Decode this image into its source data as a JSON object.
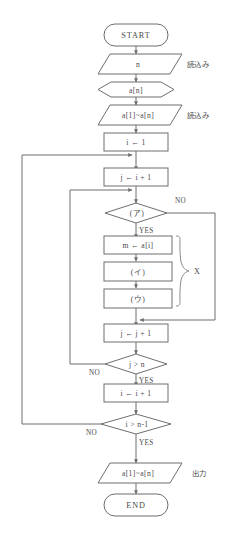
{
  "diagram": {
    "colors": {
      "stroke": "#6e6e6e",
      "text": "#4a4a4a",
      "background": "#ffffff",
      "brace": "#8a8a8a"
    },
    "nodes": [
      {
        "id": "start",
        "shape": "terminator",
        "label": "START"
      },
      {
        "id": "read-n",
        "shape": "parallelogram",
        "label": "n"
      },
      {
        "id": "prepare-an",
        "shape": "hexagon",
        "label": "a[n]"
      },
      {
        "id": "read-array",
        "shape": "parallelogram",
        "label": "a[1]~a[n]"
      },
      {
        "id": "init-i",
        "shape": "process",
        "label": "i ← 1"
      },
      {
        "id": "set-j",
        "shape": "process",
        "label": "j ← i + 1"
      },
      {
        "id": "cond-a",
        "shape": "decision",
        "label": "(ア)"
      },
      {
        "id": "set-m",
        "shape": "process",
        "label": "m ← a[i]"
      },
      {
        "id": "step-i2",
        "shape": "process",
        "label": "(イ)"
      },
      {
        "id": "step-u",
        "shape": "process",
        "label": "(ウ)"
      },
      {
        "id": "incr-j",
        "shape": "process",
        "label": "j ← j + 1"
      },
      {
        "id": "cond-j",
        "shape": "decision",
        "label": "j > n"
      },
      {
        "id": "incr-i",
        "shape": "process",
        "label": "i ← i + 1"
      },
      {
        "id": "cond-i",
        "shape": "decision",
        "label": "i > n-1"
      },
      {
        "id": "output",
        "shape": "parallelogram",
        "label": "a[1]~a[n]"
      },
      {
        "id": "end",
        "shape": "terminator",
        "label": "END"
      }
    ],
    "branch_labels": {
      "cond_a_no": "NO",
      "cond_a_yes": "YES",
      "cond_j_no": "NO",
      "cond_j_yes": "YES",
      "cond_i_no": "NO",
      "cond_i_yes": "YES"
    },
    "side_annotations": [
      {
        "id": "read-n-note",
        "text": "読込み"
      },
      {
        "id": "read-array-note",
        "text": "読込み"
      },
      {
        "id": "output-note",
        "text": "出力"
      }
    ],
    "group_label": {
      "id": "group-x",
      "text": "X"
    }
  }
}
